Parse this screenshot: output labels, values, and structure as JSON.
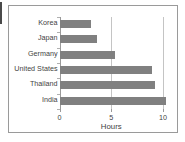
{
  "chart_data": {
    "type": "bar",
    "orientation": "horizontal",
    "title": "",
    "xlabel": "Hours",
    "ylabel": "",
    "categories": [
      "Korea",
      "Japan",
      "Germany",
      "United States",
      "Thailand",
      "India"
    ],
    "values": [
      3.0,
      3.6,
      5.4,
      8.9,
      9.2,
      10.3
    ],
    "xlim": [
      0,
      10.3
    ],
    "xticks": [
      0,
      5,
      10
    ],
    "xtick_labels": [
      "0",
      "5",
      "10"
    ],
    "grid": true,
    "grid_axis": "x",
    "legend": false,
    "bar_color": "#808080",
    "grid_color": "#c4c4c4",
    "axis_color": "#9a9a9a",
    "text_color": "#3f3f3f"
  }
}
